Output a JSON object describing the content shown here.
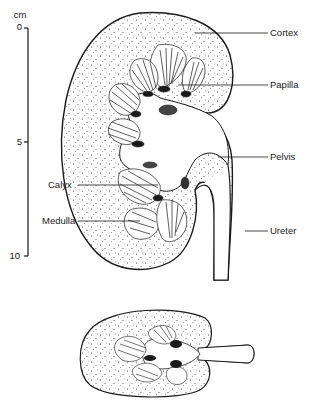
{
  "diagram": {
    "scale": {
      "unit": "cm",
      "ticks": [
        {
          "label": "0",
          "value": 0
        },
        {
          "label": "5",
          "value": 5
        },
        {
          "label": "10",
          "value": 10
        }
      ]
    },
    "labels": {
      "cortex": "Cortex",
      "papilla": "Papilla",
      "pelvis": "Pelvis",
      "calyx": "Calyx",
      "medulla": "Medulla",
      "ureter": "Ureter"
    },
    "colors": {
      "ink": "#1a1a1a",
      "background": "#ffffff"
    }
  }
}
